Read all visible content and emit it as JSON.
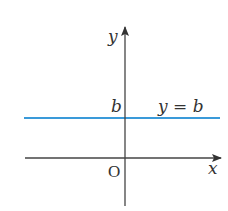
{
  "diagram": {
    "axes": {
      "x_label": "x",
      "y_label": "y",
      "origin_label": "O",
      "color": "#444444"
    },
    "line": {
      "equation_label": "y = b",
      "intercept_label": "b",
      "color": "#3a9ad9",
      "type": "horizontal"
    }
  }
}
